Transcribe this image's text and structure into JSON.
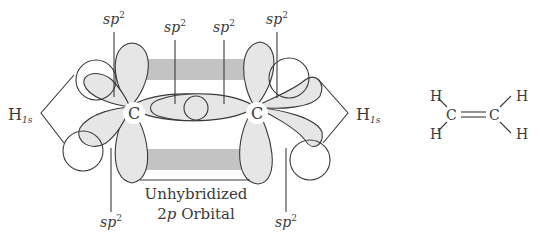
{
  "diagram": {
    "labels": {
      "sp2_top_left": "sp",
      "sp2_top_left_sup": "2",
      "sp2_top_center_left": "sp",
      "sp2_top_center_left_sup": "2",
      "sp2_top_center_right": "sp",
      "sp2_top_center_right_sup": "2",
      "sp2_top_right": "sp",
      "sp2_top_right_sup": "2",
      "sp2_bottom_left": "sp",
      "sp2_bottom_left_sup": "2",
      "sp2_bottom_right": "sp",
      "sp2_bottom_right_sup": "2",
      "h1s_left": "H",
      "h1s_left_sub": "1s",
      "h1s_right": "H",
      "h1s_right_sub": "1s",
      "carbon_left": "C",
      "carbon_right": "C",
      "unhybridized_line1": "Unhybridized",
      "unhybridized_line2_num": "2",
      "unhybridized_line2_p": "p",
      "unhybridized_line2_rest": " Orbital"
    },
    "structure": {
      "h_top_left": "H",
      "h_bottom_left": "H",
      "c_left": "C",
      "c_right": "C",
      "h_top_right": "H",
      "h_bottom_right": "H"
    },
    "colors": {
      "lobe_fill": "#e6e6e6",
      "p_orbital_fill": "#c3c3c3",
      "stroke": "#3a3a3a"
    }
  }
}
